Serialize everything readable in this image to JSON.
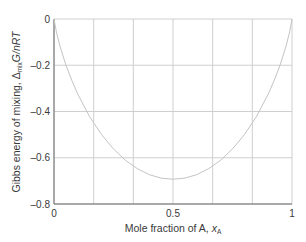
{
  "chart_data": {
    "type": "line",
    "title": "",
    "xlabel": "Mole fraction of A, x_A",
    "xlabel_parts": {
      "main": "Mole fraction of A, ",
      "var": "x",
      "sub": "A"
    },
    "ylabel": "Gibbs energy of mixing, Δ_mix G/nRT",
    "ylabel_parts": {
      "main": "Gibbs energy of mixing, Δ",
      "sub": "mix",
      "rest": "G/nRT"
    },
    "xlim": [
      0,
      1
    ],
    "ylim": [
      -0.8,
      0
    ],
    "x_ticks": [
      {
        "value": 0,
        "label": "0"
      },
      {
        "value": 0.5,
        "label": "0.5"
      },
      {
        "value": 1,
        "label": "1"
      }
    ],
    "y_ticks": [
      {
        "value": 0,
        "label": "0"
      },
      {
        "value": -0.2,
        "label": "–0.2"
      },
      {
        "value": -0.4,
        "label": "–0.4"
      },
      {
        "value": -0.6,
        "label": "–0.6"
      },
      {
        "value": -0.8,
        "label": "–0.8"
      }
    ],
    "x_gridlines": [
      0,
      0.1667,
      0.3333,
      0.5,
      0.6667,
      0.8333,
      1
    ],
    "y_gridlines": [
      0,
      -0.2,
      -0.4,
      -0.6,
      -0.8
    ],
    "grid": true,
    "legend": null,
    "series": [
      {
        "name": "Δmix G/nRT",
        "x": [
          0,
          0.01,
          0.025,
          0.05,
          0.075,
          0.1,
          0.15,
          0.2,
          0.25,
          0.3,
          0.35,
          0.4,
          0.45,
          0.5,
          0.55,
          0.6,
          0.65,
          0.7,
          0.75,
          0.8,
          0.85,
          0.9,
          0.925,
          0.95,
          0.975,
          0.99,
          1
        ],
        "values": [
          0,
          -0.056,
          -0.117,
          -0.199,
          -0.266,
          -0.325,
          -0.423,
          -0.5,
          -0.562,
          -0.611,
          -0.647,
          -0.673,
          -0.688,
          -0.693,
          -0.688,
          -0.673,
          -0.647,
          -0.611,
          -0.562,
          -0.5,
          -0.423,
          -0.325,
          -0.266,
          -0.199,
          -0.117,
          -0.056,
          0
        ]
      }
    ],
    "colors": {
      "curve": "#c4c4c4",
      "grid": "#cfcfcf",
      "axis": "#6a6a6a",
      "text": "#3a3a3a"
    }
  }
}
